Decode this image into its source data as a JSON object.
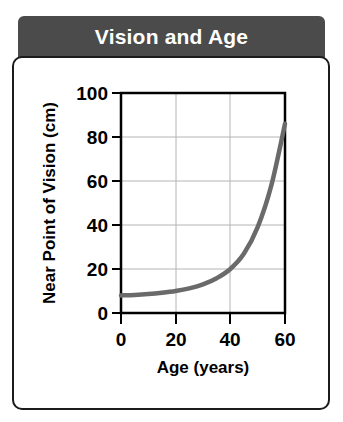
{
  "title": {
    "text": "Vision and Age"
  },
  "colors": {
    "title_bar_bg": "#4b4b4b",
    "title_text": "#ffffff",
    "card_bg": "#ffffff",
    "card_border": "#1b1b1b",
    "axis": "#000000",
    "gridline": "#b4b4b4",
    "curve": "#6a6a6a"
  },
  "chart_data": {
    "type": "line",
    "title": "Vision and Age",
    "xlabel": "Age (years)",
    "ylabel": "Near Point of Vision (cm)",
    "xlim": [
      0,
      60
    ],
    "ylim": [
      0,
      100
    ],
    "xticks": [
      0,
      20,
      40,
      60
    ],
    "yticks": [
      0,
      20,
      40,
      60,
      80,
      100
    ],
    "xtick_labels": [
      "0",
      "20",
      "40",
      "60"
    ],
    "ytick_labels": [
      "0",
      "20",
      "40",
      "60",
      "80",
      "100"
    ],
    "grid": true,
    "grid_axes": "both",
    "legend": null,
    "series": [
      {
        "name": "Near point of vision",
        "x": [
          0,
          5,
          10,
          15,
          20,
          25,
          30,
          35,
          40,
          45,
          50,
          55,
          60
        ],
        "y": [
          8,
          8.2,
          8.6,
          9.2,
          10,
          11.2,
          13,
          15.8,
          20,
          27,
          39,
          58,
          86
        ]
      }
    ]
  }
}
